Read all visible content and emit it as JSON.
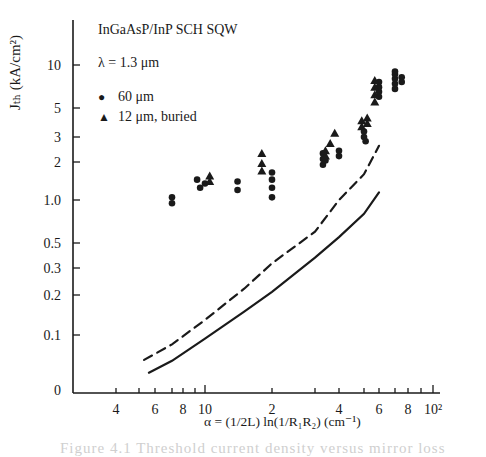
{
  "chart_data": {
    "type": "scatter",
    "title": "InGaAsP/InP SCH SQW",
    "annotation": "λ = 1.3 μm",
    "xlabel": "α = (1/2L) ln(1/R₁R₂)   (cm⁻¹)",
    "ylabel": "J_th (kA/cm²)",
    "x_scale": "log",
    "y_scale": "log",
    "xlim": [
      3,
      130
    ],
    "ylim": [
      0.04,
      20
    ],
    "x_ticks": [
      4,
      5,
      6,
      7,
      8,
      9,
      10,
      20,
      30,
      40,
      50,
      60,
      70,
      80,
      90,
      100
    ],
    "x_tick_labels": [
      "4",
      "6",
      "8",
      "10",
      "2",
      "4",
      "6",
      "8",
      "10²"
    ],
    "y_tick_labels": [
      "10",
      "5",
      "3",
      "2",
      "1.0",
      "0.5",
      "0.3",
      "0.2",
      "0.1",
      "0"
    ],
    "grid": false,
    "legend": [
      {
        "marker": "circle",
        "label": "60 μm"
      },
      {
        "marker": "triangle",
        "label": "12 μm, buried"
      }
    ],
    "legend_position": "upper-left",
    "series": [
      {
        "name": "60 μm",
        "marker": "circle",
        "points": [
          [
            7,
            1.05
          ],
          [
            7,
            0.95
          ],
          [
            9.2,
            1.45
          ],
          [
            9.5,
            1.25
          ],
          [
            10,
            1.35
          ],
          [
            14,
            1.4
          ],
          [
            14,
            1.2
          ],
          [
            20,
            1.65
          ],
          [
            20,
            1.45
          ],
          [
            20,
            1.25
          ],
          [
            20,
            1.05
          ],
          [
            33,
            2.1
          ],
          [
            33,
            1.9
          ],
          [
            33,
            2.3
          ],
          [
            34,
            2.05
          ],
          [
            40,
            2.4
          ],
          [
            40,
            2.2
          ],
          [
            50,
            3.0
          ],
          [
            50,
            3.3
          ],
          [
            51,
            2.8
          ],
          [
            60,
            6.0
          ],
          [
            60,
            6.5
          ],
          [
            60,
            7.0
          ],
          [
            60,
            7.6
          ],
          [
            70,
            6.8
          ],
          [
            70,
            7.4
          ],
          [
            70,
            8.0
          ],
          [
            70,
            8.6
          ],
          [
            70,
            9.0
          ],
          [
            75,
            8.2
          ],
          [
            75,
            7.6
          ]
        ]
      },
      {
        "name": "12 μm, buried",
        "marker": "triangle",
        "points": [
          [
            10.5,
            1.4
          ],
          [
            10.5,
            1.55
          ],
          [
            18,
            1.7
          ],
          [
            18,
            1.95
          ],
          [
            18,
            2.3
          ],
          [
            34,
            2.4
          ],
          [
            34,
            2.2
          ],
          [
            36,
            2.7
          ],
          [
            38,
            3.2
          ],
          [
            49,
            4.0
          ],
          [
            49,
            3.6
          ],
          [
            52,
            4.2
          ],
          [
            52,
            3.8
          ],
          [
            57,
            5.5
          ],
          [
            57,
            6.2
          ],
          [
            57,
            7.0
          ],
          [
            57,
            7.8
          ]
        ]
      },
      {
        "name": "theory (dashed)",
        "style": "dashed",
        "points": [
          [
            5.3,
            0.065
          ],
          [
            7,
            0.085
          ],
          [
            10,
            0.13
          ],
          [
            15,
            0.22
          ],
          [
            20,
            0.33
          ],
          [
            30,
            0.6
          ],
          [
            40,
            1.0
          ],
          [
            50,
            1.6
          ],
          [
            60,
            2.6
          ]
        ]
      },
      {
        "name": "theory (solid)",
        "style": "solid",
        "points": [
          [
            5.6,
            0.052
          ],
          [
            7,
            0.064
          ],
          [
            10,
            0.094
          ],
          [
            15,
            0.15
          ],
          [
            20,
            0.21
          ],
          [
            30,
            0.37
          ],
          [
            40,
            0.55
          ],
          [
            50,
            0.8
          ],
          [
            60,
            1.15
          ]
        ]
      }
    ]
  },
  "text": {
    "title": "InGaAsP/InP SCH SQW",
    "wavelength": "λ = 1.3 μm",
    "legend_circle_label": "60 μm",
    "legend_triangle_label": "12 μm, buried",
    "legend_circle_symbol": "●",
    "legend_triangle_symbol": "▲",
    "ylabel": "Jₜₕ (kA/cm²)",
    "xlabel": "α = (1/2L) ln(1/R₁R₂)   (cm⁻¹)",
    "caption": "Figure 4.1  Threshold current density versus mirror loss"
  },
  "layout": {
    "plot": {
      "x0": 73,
      "y0": 393,
      "x_top": 20,
      "x_right": 440
    },
    "x_tick_px": {
      "4": 116,
      "5": 139,
      "6": 155,
      "7": 172,
      "8": 183,
      "9": 195,
      "10": 205,
      "20": 272,
      "30": 315,
      "40": 339,
      "50": 364,
      "60": 379,
      "70": 395,
      "80": 408,
      "90": 421,
      "100": 433
    },
    "y_tick_px": {
      "10": 65,
      "5": 108,
      "3": 137,
      "2": 162,
      "1.0": 200,
      "0.5": 243,
      "0.3": 268,
      "0.2": 295,
      "0.1": 335,
      "0": 390
    },
    "ink": "#1a1a1a"
  }
}
